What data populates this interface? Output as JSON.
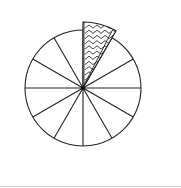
{
  "diagram": {
    "type": "fraction-circle",
    "total_parts": 12,
    "shaded_parts": 1,
    "fraction": "1/12",
    "center": [
      83,
      88
    ],
    "radius": 58,
    "exploded_slice": {
      "index": 0,
      "start_angle_deg": 0,
      "end_angle_deg": 30,
      "offset_px": 0,
      "outer_radius": 66,
      "fill_pattern": "zigzag",
      "edge_band_color": "#9a9a9a"
    },
    "colors": {
      "stroke": "#222222",
      "background": "#ffffff",
      "bottom_rule": "#c8c8c8"
    }
  }
}
